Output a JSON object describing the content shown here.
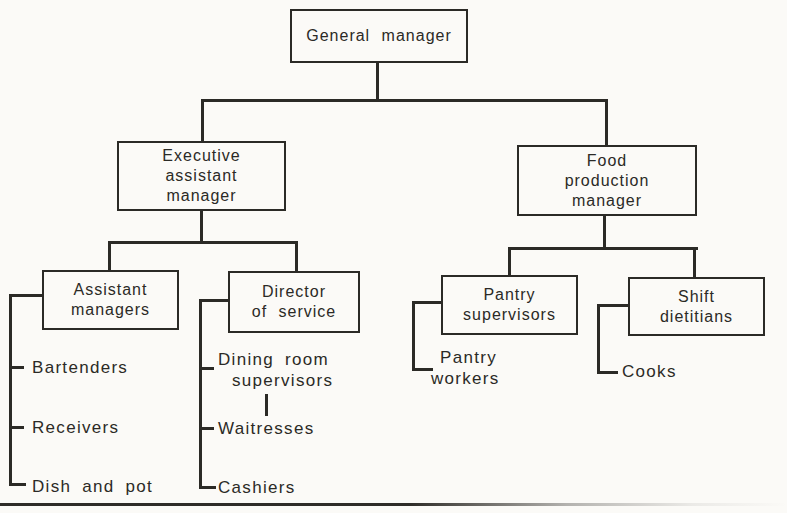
{
  "figure": {
    "type": "organization-chart",
    "background_color": "#fbfaf7",
    "ink_color": "#2b2a26"
  },
  "nodes": {
    "general_manager": {
      "label": "General manager"
    },
    "executive_assistant_manager": {
      "line1": "Executive",
      "line2": "assistant",
      "line3": "manager"
    },
    "food_production_manager": {
      "line1": "Food",
      "line2": "production",
      "line3": "manager"
    },
    "assistant_managers": {
      "line1": "Assistant",
      "line2": "managers"
    },
    "director_of_service": {
      "line1": "Director",
      "line2": "of service"
    },
    "pantry_supervisors": {
      "line1": "Pantry",
      "line2": "supervisors"
    },
    "shift_dietitians": {
      "line1": "Shift",
      "line2": "dietitians"
    }
  },
  "leaves": {
    "bartenders": "Bartenders",
    "receivers": "Receivers",
    "dish_and_pot": "Dish and pot",
    "dining_room_supervisors_line1": "Dining room",
    "dining_room_supervisors_line2": "supervisors",
    "waitresses": "Waitresses",
    "cashiers": "Cashiers",
    "pantry_workers_line1": "Pantry",
    "pantry_workers_line2": "workers",
    "cooks": "Cooks"
  },
  "hierarchy": {
    "root": "General manager",
    "children": [
      {
        "name": "Executive assistant manager",
        "children": [
          {
            "name": "Assistant managers",
            "reports": [
              "Bartenders",
              "Receivers",
              "Dish and pot"
            ]
          },
          {
            "name": "Director of service",
            "reports": [
              "Dining room supervisors",
              "Waitresses (under Dining room supervisors)",
              "Cashiers"
            ]
          }
        ]
      },
      {
        "name": "Food production manager",
        "children": [
          {
            "name": "Pantry supervisors",
            "reports": [
              "Pantry workers"
            ]
          },
          {
            "name": "Shift dietitians",
            "reports": [
              "Cooks"
            ]
          }
        ]
      }
    ]
  }
}
